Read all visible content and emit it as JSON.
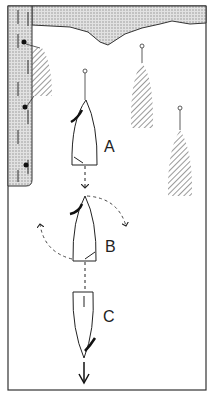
{
  "diagram": {
    "title": "",
    "labels": {
      "a": "A",
      "b": "B",
      "c": "C"
    },
    "elements": [
      {
        "id": "quay",
        "type": "pontoon / quay wall with mooring bollards"
      },
      {
        "id": "shore",
        "type": "shoreline at top"
      },
      {
        "id": "moored-boat-1",
        "type": "hatched boat alongside quay"
      },
      {
        "id": "moored-boat-2",
        "type": "hatched boat on mooring buoy"
      },
      {
        "id": "moored-boat-3",
        "type": "hatched boat on mooring buoy"
      },
      {
        "id": "boat-a",
        "label": "A"
      },
      {
        "id": "boat-b",
        "label": "B"
      },
      {
        "id": "boat-c",
        "label": "C"
      }
    ],
    "colors": {
      "ink": "#222222",
      "hatch": "#555555",
      "fill": "#d8d8d8"
    }
  }
}
